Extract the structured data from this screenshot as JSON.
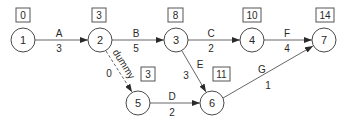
{
  "diagram": {
    "type": "activity-on-arrow network",
    "nodes": [
      {
        "id": "1",
        "label": "1",
        "earliest_time": "0"
      },
      {
        "id": "2",
        "label": "2",
        "earliest_time": "3"
      },
      {
        "id": "3",
        "label": "3",
        "earliest_time": "8"
      },
      {
        "id": "4",
        "label": "4",
        "earliest_time": "10"
      },
      {
        "id": "5",
        "label": "5",
        "earliest_time": "3"
      },
      {
        "id": "6",
        "label": "6",
        "earliest_time": "11"
      },
      {
        "id": "7",
        "label": "7",
        "earliest_time": "14"
      }
    ],
    "edges": [
      {
        "from": "1",
        "to": "2",
        "activity": "A",
        "duration": "3"
      },
      {
        "from": "2",
        "to": "3",
        "activity": "B",
        "duration": "5"
      },
      {
        "from": "3",
        "to": "4",
        "activity": "C",
        "duration": "2"
      },
      {
        "from": "4",
        "to": "7",
        "activity": "F",
        "duration": "4"
      },
      {
        "from": "2",
        "to": "5",
        "activity": "dummy",
        "duration": "0",
        "style": "dashed"
      },
      {
        "from": "3",
        "to": "6",
        "activity": "E",
        "duration": "3"
      },
      {
        "from": "5",
        "to": "6",
        "activity": "D",
        "duration": "2"
      },
      {
        "from": "6",
        "to": "7",
        "activity": "G",
        "duration": "1"
      }
    ]
  }
}
